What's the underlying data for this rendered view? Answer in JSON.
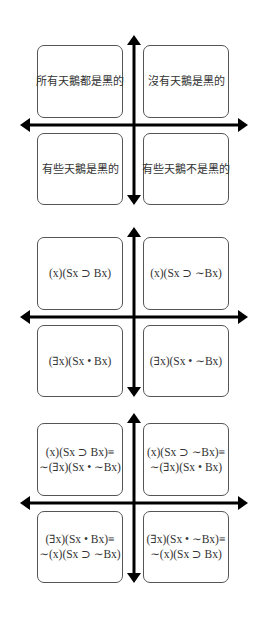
{
  "diagrams": [
    {
      "name": "square-of-opposition-chinese",
      "top": 33,
      "quadrants": {
        "top_left": [
          "所有天鵝都是黑的"
        ],
        "top_right": [
          "沒有天鵝是黑的"
        ],
        "bottom_left": [
          "有些天鵝是黑的"
        ],
        "bottom_right": [
          "有些天鵝不是黑的"
        ]
      }
    },
    {
      "name": "square-of-opposition-symbolic",
      "top": 225,
      "quadrants": {
        "top_left": [
          "(x)(Sx ⊃ Bx)"
        ],
        "top_right": [
          "(x)(Sx ⊃ ∼Bx)"
        ],
        "bottom_left": [
          "(∃x)(Sx • Bx)"
        ],
        "bottom_right": [
          "(∃x)(Sx • ∼Bx)"
        ]
      }
    },
    {
      "name": "square-of-opposition-equivalences",
      "top": 411,
      "quadrants": {
        "top_left": [
          "(x)(Sx ⊃ Bx)≡",
          "∼(∃x)(Sx • ∼Bx)"
        ],
        "top_right": [
          "(x)(Sx ⊃ ∼Bx)≡",
          "∼(∃x)(Sx • Bx)"
        ],
        "bottom_left": [
          "(∃x)(Sx • Bx)≡",
          "∼(x)(Sx ⊃ ∼Bx)"
        ],
        "bottom_right": [
          "(∃x)(Sx • ∼Bx)≡",
          "∼(x)(Sx ⊃ Bx)"
        ]
      }
    }
  ],
  "style": {
    "arrow_color": "#000000",
    "box_border": "#555555"
  }
}
